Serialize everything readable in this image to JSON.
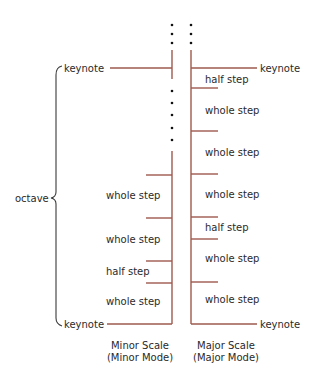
{
  "colors": {
    "scale_line": "#9e5a4e",
    "text": "#2a2a2a",
    "brace": "#3a3a3a",
    "background": "#ffffff"
  },
  "octave": {
    "label": "octave"
  },
  "minor": {
    "top_keynote": "keynote",
    "bottom_keynote": "keynote",
    "steps": [
      "whole step",
      "whole step",
      "half step",
      "whole step"
    ],
    "caption_line1": "Minor Scale",
    "caption_line2": "(Minor Mode)"
  },
  "major": {
    "top_keynote": "keynote",
    "bottom_keynote": "keynote",
    "steps": [
      "half step",
      "whole step",
      "whole step",
      "whole step",
      "half step",
      "whole step",
      "whole step"
    ],
    "caption_line1": "Major Scale",
    "caption_line2": "(Major Mode)"
  }
}
